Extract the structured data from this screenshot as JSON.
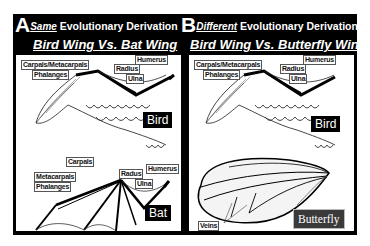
{
  "panels": [
    {
      "letter": "A",
      "qualifier": "Same",
      "heading": " Evolutionary Derivation",
      "subtitle": "Bird Wing Vs. Bat Wing",
      "top_figure": {
        "tag": "Bird",
        "labels": [
          "Carpals/Metacarpals",
          "Phalanges",
          "Radius",
          "Ulna",
          "Humerus"
        ]
      },
      "bottom_figure": {
        "tag": "Bat",
        "labels": [
          "Carpals",
          "Metacarpals",
          "Phalanges",
          "Radus",
          "Ulna",
          "Humerus"
        ]
      }
    },
    {
      "letter": "B",
      "qualifier": "Different",
      "heading": " Evolutionary Derivation",
      "subtitle": "Bird Wing Vs. Butterfly Wing",
      "top_figure": {
        "tag": "Bird",
        "labels": [
          "Carpals/Metacarpals",
          "Phalanges",
          "Radius",
          "Ulna",
          "Humerus"
        ]
      },
      "bottom_figure": {
        "tag": "Butterfly",
        "labels": [
          "Veins"
        ]
      }
    }
  ],
  "colors": {
    "frame": "#000000",
    "panel_bg": "#ffffff",
    "bird_tag_bg": "#000000",
    "butterfly_tag_bg": "#3a3a3a"
  }
}
